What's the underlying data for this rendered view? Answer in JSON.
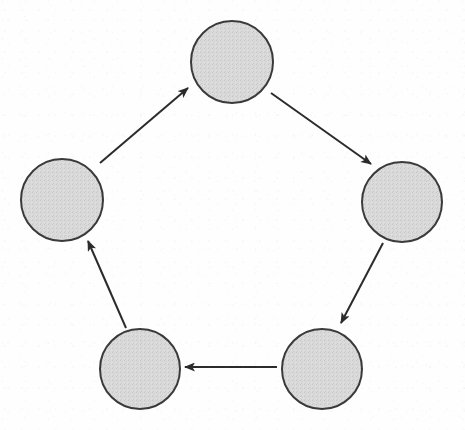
{
  "diagram": {
    "type": "directed-cycle",
    "direction": "clockwise",
    "canvas": {
      "width": 465,
      "height": 430
    },
    "style": {
      "background_color": "#fefefe",
      "node_fill_color": "#d8d8d8",
      "node_stroke_color": "#3a3a3a",
      "node_stroke_width": 2,
      "arrow_color": "#2b2b2b",
      "arrow_stroke_width": 2
    },
    "nodes": [
      {
        "id": "node-top",
        "label": "",
        "position": "top",
        "cx": 232,
        "cy": 62,
        "r": 41
      },
      {
        "id": "node-right",
        "label": "",
        "position": "right",
        "cx": 402,
        "cy": 202,
        "r": 40
      },
      {
        "id": "node-bottom-right",
        "label": "",
        "position": "bottom-right",
        "cx": 322,
        "cy": 369,
        "r": 40
      },
      {
        "id": "node-bottom-left",
        "label": "",
        "position": "bottom-left",
        "cx": 140,
        "cy": 369,
        "r": 40
      },
      {
        "id": "node-left",
        "label": "",
        "position": "left",
        "cx": 62,
        "cy": 200,
        "r": 41
      }
    ],
    "edges": [
      {
        "id": "edge-left-to-top",
        "from": "node-left",
        "to": "node-top",
        "x1": 100,
        "y1": 163,
        "x2": 188,
        "y2": 88,
        "arrowhead": "end"
      },
      {
        "id": "edge-top-to-right",
        "from": "node-top",
        "to": "node-right",
        "x1": 271,
        "y1": 93,
        "x2": 371,
        "y2": 164,
        "arrowhead": "end"
      },
      {
        "id": "edge-right-to-bottom-right",
        "from": "node-right",
        "to": "node-bottom-right",
        "x1": 383,
        "y1": 243,
        "x2": 341,
        "y2": 323,
        "arrowhead": "end"
      },
      {
        "id": "edge-bottom-right-to-bottom-left",
        "from": "node-bottom-right",
        "to": "node-bottom-left",
        "x1": 277,
        "y1": 367,
        "x2": 185,
        "y2": 367,
        "arrowhead": "end"
      },
      {
        "id": "edge-bottom-left-to-left",
        "from": "node-bottom-left",
        "to": "node-left",
        "x1": 126,
        "y1": 328,
        "x2": 88,
        "y2": 241,
        "arrowhead": "end"
      }
    ]
  }
}
